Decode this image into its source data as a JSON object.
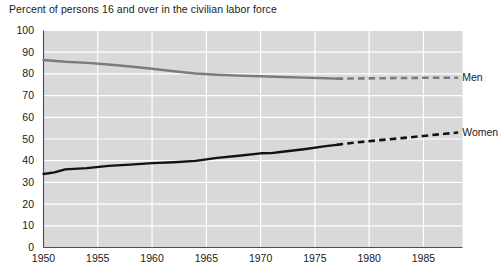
{
  "chart_data": {
    "type": "line",
    "title": "Percent of persons 16 and over in the civilian labor force",
    "xlabel": "",
    "ylabel": "",
    "xlim": [
      1950,
      1988.6
    ],
    "ylim": [
      0,
      100
    ],
    "grid": true,
    "legend_position": "right-inline",
    "x_ticks": [
      1950,
      1955,
      1960,
      1965,
      1970,
      1975,
      1980,
      1985
    ],
    "x_tick_labels": [
      "1950",
      "1955",
      "1960",
      "1965",
      "1970",
      "1975",
      "1980",
      "1985"
    ],
    "y_ticks": [
      0,
      10,
      20,
      30,
      40,
      50,
      60,
      70,
      80,
      90,
      100
    ],
    "y_tick_labels": [
      "0",
      "10",
      "20",
      "30",
      "40",
      "50",
      "60",
      "70",
      "80",
      "90",
      "100"
    ],
    "series": [
      {
        "name": "Men",
        "label": "Men",
        "color": "#7b7b7b",
        "solid_x": [
          1950,
          1952,
          1954,
          1956,
          1958,
          1960,
          1962,
          1964,
          1966,
          1968,
          1970,
          1972,
          1974,
          1976,
          1977
        ],
        "solid_values": [
          86.4,
          85.6,
          85.1,
          84.3,
          83.4,
          82.4,
          81.2,
          80.2,
          79.6,
          79.2,
          78.9,
          78.6,
          78.3,
          78.0,
          77.8
        ],
        "dashed_x": [
          1977,
          1979,
          1981,
          1983,
          1985,
          1987,
          1988.2
        ],
        "dashed_values": [
          77.8,
          77.9,
          78.0,
          78.1,
          78.2,
          78.2,
          78.2
        ],
        "projection_note": "dashed after 1977"
      },
      {
        "name": "Women",
        "label": "Women",
        "color": "#121212",
        "solid_x": [
          1950,
          1951,
          1952,
          1954,
          1956,
          1958,
          1960,
          1962,
          1964,
          1966,
          1968,
          1970,
          1971,
          1972,
          1974,
          1976,
          1977
        ],
        "solid_values": [
          33.9,
          34.6,
          36.0,
          36.6,
          37.6,
          38.2,
          38.9,
          39.3,
          39.9,
          41.3,
          42.3,
          43.4,
          43.5,
          44.1,
          45.3,
          46.7,
          47.3
        ],
        "dashed_x": [
          1977,
          1979,
          1981,
          1983,
          1985,
          1987,
          1988.2
        ],
        "dashed_values": [
          47.3,
          48.5,
          49.5,
          50.4,
          51.4,
          52.4,
          53.0
        ],
        "projection_note": "dashed after 1977"
      }
    ],
    "colors": {
      "plot_background": "#d9d9d9",
      "gridline": "#ffffff",
      "axis": "#4d4d4d",
      "men": "#7b7b7b",
      "women": "#121212",
      "text": "#1a1a1a"
    }
  }
}
